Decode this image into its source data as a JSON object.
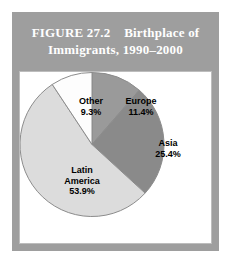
{
  "figure": {
    "title_line1": "FIGURE 27.2    Birthplace of",
    "title_line2": "Immigrants, 1990–2000",
    "header_bg": "#9e9e9e",
    "header_text_color": "#ffffff",
    "panel_bg": "#ffffff",
    "panel_border": "#bdbdbd"
  },
  "chart_data": {
    "type": "pie",
    "title": "FIGURE 27.2    Birthplace of Immigrants, 1990–2000",
    "xlabel": "",
    "ylabel": "",
    "legend": "none",
    "grid": false,
    "labels_on_slices": true,
    "start_angle_deg": 0,
    "direction": "clockwise",
    "categories": [
      "Europe",
      "Asia",
      "Latin America",
      "Other"
    ],
    "values": [
      11.4,
      25.4,
      53.9,
      9.3
    ],
    "unit": "%",
    "colors": [
      "#9a9a9a",
      "#8a8a8a",
      "#dcdcdc",
      "#fdfdfd"
    ],
    "slice_edge_color": "#8c8c8c",
    "slices": [
      {
        "name": "Europe",
        "value": 11.4,
        "value_label": "11.4%",
        "color": "#9a9a9a"
      },
      {
        "name": "Asia",
        "value": 25.4,
        "value_label": "25.4%",
        "color": "#8a8a8a"
      },
      {
        "name": "Latin America",
        "value": 53.9,
        "value_label": "53.9%",
        "color": "#dcdcdc"
      },
      {
        "name": "Other",
        "value": 9.3,
        "value_label": "9.3%",
        "color": "#fdfdfd"
      }
    ]
  },
  "labels": {
    "europe": {
      "name": "Europe",
      "value": "11.4%"
    },
    "asia": {
      "name": "Asia",
      "value": "25.4%"
    },
    "latin_line1": "Latin",
    "latin_line2": "America",
    "latin_value": "53.9%",
    "other": {
      "name": "Other",
      "value": "9.3%"
    }
  }
}
